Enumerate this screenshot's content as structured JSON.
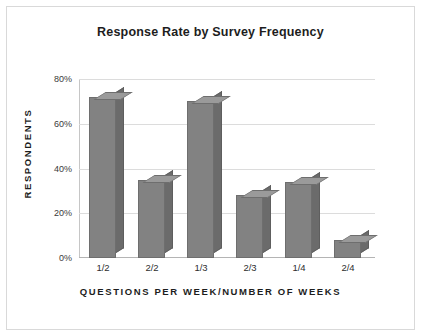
{
  "chart_data": {
    "type": "bar",
    "title": "Response Rate by Survey Frequency",
    "xlabel": "QUESTIONS PER WEEK/NUMBER OF WEEKS",
    "ylabel": "RESPONDENTS",
    "categories": [
      "1/2",
      "2/2",
      "1/3",
      "2/3",
      "1/4",
      "2/4"
    ],
    "values": [
      72,
      35,
      70,
      28,
      34,
      8
    ],
    "value_labels": [
      "72%",
      "35%",
      "70%",
      "28%",
      "34%",
      "8%"
    ],
    "ylim": [
      0,
      80
    ],
    "yticks": [
      0,
      20,
      40,
      60,
      80
    ],
    "ytick_labels": [
      "0%",
      "20%",
      "40%",
      "60%",
      "80%"
    ],
    "grid": true,
    "legend": false,
    "legend_position": "none",
    "bar_color": "#828282",
    "bar_side_color": "#6b6b6b",
    "bar_top_color": "#9a9a9a",
    "gridline_color": "#dcdcdc",
    "axis_color": "#b4b4b4",
    "background_color": "#ffffff",
    "frame_color": "#d9d9d9",
    "text_color": "#1d1d1d",
    "style": "3d-column"
  }
}
